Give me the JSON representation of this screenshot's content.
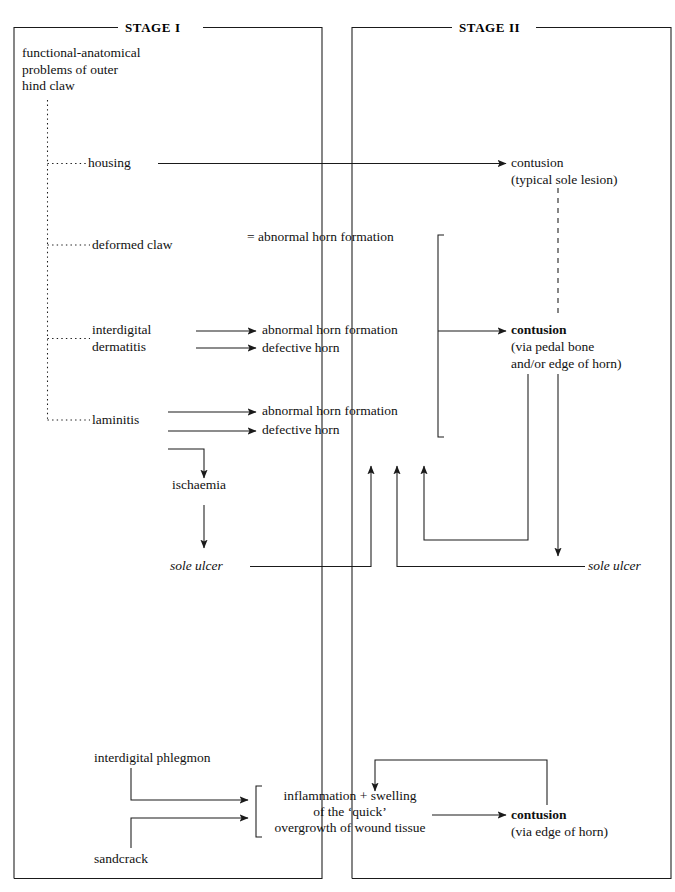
{
  "diagram": {
    "stages": [
      {
        "id": "stage-1",
        "title": "STAGE I"
      },
      {
        "id": "stage-2",
        "title": "STAGE II"
      }
    ],
    "nodes": {
      "root_cause": "functional-anatomical\nproblems of outer\nhind claw",
      "housing": "housing",
      "deformed_claw": "deformed claw",
      "interdigital": "interdigital",
      "dermatitis": "dermatitis",
      "laminitis": "laminitis",
      "eq_abnormal_horn": "= abnormal horn formation",
      "abnormal_horn_1": "abnormal horn formation",
      "defective_horn_1": "defective horn",
      "abnormal_horn_2": "abnormal horn formation",
      "defective_horn_2": "defective horn",
      "ischaemia": "ischaemia",
      "sole_ulcer_left": "sole ulcer",
      "sole_ulcer_right": "sole ulcer",
      "contusion_typical": "contusion",
      "contusion_typical_sub": "(typical sole lesion)",
      "contusion_pedal": "contusion",
      "contusion_pedal_sub": "(via pedal bone\nand/or edge of horn)",
      "interdigital_phlegmon": "interdigital phlegmon",
      "sandcrack": "sandcrack",
      "inflammation_l1": "inflammation + swelling",
      "inflammation_l2": "of the ‘quick’",
      "inflammation_l3": "overgrowth of wound tissue",
      "contusion_edge": "contusion",
      "contusion_edge_sub": "(via edge of horn)"
    },
    "colors": {
      "line": "#1a1a1a",
      "text": "#111111",
      "background": "#ffffff"
    }
  }
}
